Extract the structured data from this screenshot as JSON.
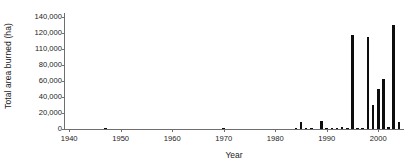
{
  "chart_data": {
    "type": "bar",
    "title": "",
    "xlabel": "Year",
    "ylabel": "Total area burned (ha)",
    "xlim": [
      1939,
      2005
    ],
    "ylim": [
      0,
      140000
    ],
    "grid": false,
    "legend": null,
    "bar_color": "#0d0d0d",
    "axis_color": "#6e6e6e",
    "background_color": "#ffffff",
    "ytick_labels": [
      "140,000",
      "120,000",
      "110,000",
      "80,000",
      "60,000",
      "40,000",
      "20,000",
      "0"
    ],
    "ytick_values": [
      140000,
      120000,
      100000,
      80000,
      60000,
      40000,
      20000,
      0
    ],
    "xtick_labels": [
      "1940",
      "1950",
      "1960",
      "1970",
      "1980",
      "1990",
      "2000"
    ],
    "xtick_values": [
      1940,
      1950,
      1960,
      1970,
      1980,
      1990,
      2000
    ],
    "x": [
      1940,
      1941,
      1942,
      1943,
      1944,
      1945,
      1946,
      1947,
      1948,
      1949,
      1950,
      1951,
      1952,
      1953,
      1954,
      1955,
      1956,
      1957,
      1958,
      1959,
      1960,
      1961,
      1962,
      1963,
      1964,
      1965,
      1966,
      1967,
      1968,
      1969,
      1970,
      1971,
      1972,
      1973,
      1974,
      1975,
      1976,
      1977,
      1978,
      1979,
      1980,
      1981,
      1982,
      1983,
      1984,
      1985,
      1986,
      1987,
      1988,
      1989,
      1990,
      1991,
      1992,
      1993,
      1994,
      1995,
      1996,
      1997,
      1998,
      1999,
      2000,
      2001,
      2002,
      2003,
      2004
    ],
    "values": [
      0,
      0,
      0,
      0,
      0,
      0,
      0,
      300,
      0,
      0,
      0,
      0,
      0,
      0,
      0,
      0,
      0,
      0,
      0,
      0,
      0,
      0,
      0,
      0,
      0,
      0,
      0,
      0,
      0,
      0,
      600,
      0,
      0,
      0,
      0,
      0,
      0,
      0,
      0,
      0,
      0,
      0,
      0,
      0,
      800,
      9000,
      1200,
      900,
      0,
      10500,
      1500,
      1800,
      1500,
      2000,
      1800,
      117000,
      1000,
      1200,
      115000,
      30000,
      50000,
      63000,
      2500,
      130000,
      9000
    ]
  }
}
